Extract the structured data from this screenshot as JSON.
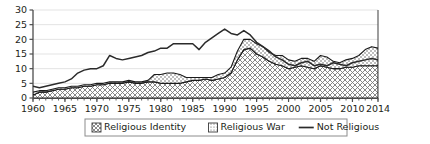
{
  "chart_data": {
    "type": "area",
    "stacked": true,
    "title": "",
    "subtitle": "",
    "xlabel": "",
    "ylabel": "",
    "xlim": [
      1960,
      2014
    ],
    "ylim": [
      0,
      30
    ],
    "yticks": [
      0,
      5,
      10,
      15,
      20,
      25,
      30
    ],
    "xticks": [
      1960,
      1965,
      1970,
      1975,
      1980,
      1985,
      1990,
      1995,
      2000,
      2005,
      2010,
      2014
    ],
    "xtick_labels": [
      "1960",
      "1965",
      "1970",
      "1975",
      "1980",
      "1985",
      "1990",
      "1995",
      "2000",
      "2005",
      "2010",
      "2014"
    ],
    "ytick_labels": [
      "0",
      "5",
      "10",
      "15",
      "20",
      "25",
      "30"
    ],
    "grid": true,
    "grid_axis": "y",
    "legend_position": "bottom",
    "minor_xticks_every": 1,
    "x": [
      1960,
      1961,
      1962,
      1963,
      1964,
      1965,
      1966,
      1967,
      1968,
      1969,
      1970,
      1971,
      1972,
      1973,
      1974,
      1975,
      1976,
      1977,
      1978,
      1979,
      1980,
      1981,
      1982,
      1983,
      1984,
      1985,
      1986,
      1987,
      1988,
      1989,
      1990,
      1991,
      1992,
      1993,
      1994,
      1995,
      1996,
      1997,
      1998,
      1999,
      2000,
      2001,
      2002,
      2003,
      2004,
      2005,
      2006,
      2007,
      2008,
      2009,
      2010,
      2011,
      2012,
      2013,
      2014
    ],
    "series": [
      {
        "name": "Religious Identity",
        "pattern": "crosshatch",
        "stack_order": 1,
        "values": [
          1,
          2,
          2,
          2.5,
          3,
          3,
          3.5,
          3.5,
          4,
          4,
          4.5,
          4.5,
          5,
          5,
          5,
          5.5,
          5,
          5,
          5.5,
          5.5,
          5,
          5,
          5,
          5,
          5.5,
          6,
          6,
          6.5,
          6,
          6.5,
          7,
          8.5,
          13,
          16.5,
          17,
          15,
          14,
          12.5,
          11.5,
          11,
          10,
          10.5,
          11,
          10.5,
          10,
          11,
          10.5,
          10,
          10,
          10.5,
          10.5,
          11,
          11,
          11,
          11
        ]
      },
      {
        "name": "Religious War",
        "pattern": "dotted",
        "stack_order": 2,
        "values": [
          1,
          0.5,
          0.5,
          0.5,
          0.5,
          0.5,
          0.5,
          0.5,
          0.5,
          0.5,
          0.5,
          0.5,
          0.5,
          0.5,
          0.5,
          0.5,
          0.5,
          0.5,
          0.5,
          2.5,
          3,
          3.5,
          3.5,
          3,
          1.5,
          1,
          1,
          0.5,
          1,
          1.5,
          1.5,
          2,
          3,
          3.5,
          3,
          3.5,
          3.5,
          3,
          3,
          3.5,
          3,
          2,
          2.5,
          3,
          2.5,
          3.5,
          3.5,
          2.5,
          2,
          2.5,
          3,
          3.5,
          5.5,
          6.5,
          6
        ]
      },
      {
        "name": "Not Religious",
        "pattern": "line",
        "stack_order": 0,
        "values": [
          4,
          3.5,
          4,
          4.5,
          5,
          5.5,
          6.5,
          8.5,
          9.5,
          10,
          10,
          11,
          14.5,
          13.5,
          13,
          13.5,
          14,
          14.5,
          15.5,
          16,
          17,
          17,
          18.5,
          18.5,
          18.5,
          18.5,
          16.5,
          19,
          20.5,
          22,
          23.5,
          22,
          21.5,
          23,
          21.5,
          19,
          17.5,
          16,
          14,
          13,
          11.5,
          11,
          12,
          12.5,
          11,
          11.5,
          11,
          12,
          11.5,
          11,
          12,
          12.5,
          13,
          13.5,
          13
        ]
      }
    ]
  },
  "legend": {
    "items": [
      {
        "label": "Religious Identity",
        "swatch": "crosshatch-swatch"
      },
      {
        "label": "Religious War",
        "swatch": "dotted-swatch"
      },
      {
        "label": "Not Religious",
        "swatch": "line-swatch"
      }
    ]
  },
  "colors": {
    "axis": "#4d4d4d",
    "grid": "#e3e3e3",
    "line": "#2b2b2b",
    "area_outline": "#1a1a1a",
    "text": "#231f20",
    "background": "#ffffff",
    "legend_border": "#8c8c8c"
  }
}
